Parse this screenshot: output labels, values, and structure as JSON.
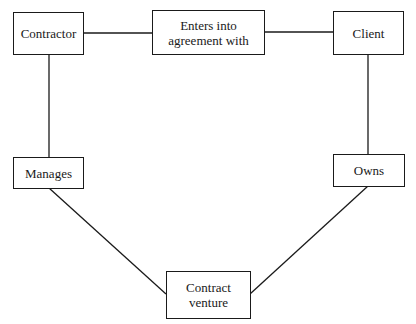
{
  "diagram": {
    "nodes": {
      "contractor": {
        "label": "Contractor"
      },
      "agreement": {
        "label": "Enters into\nagreement with"
      },
      "client": {
        "label": "Client"
      },
      "manages": {
        "label": "Manages"
      },
      "owns": {
        "label": "Owns"
      },
      "venture": {
        "label": "Contract\nventure"
      }
    },
    "edges": [
      {
        "from": "Contractor",
        "to": "Enters into agreement with"
      },
      {
        "from": "Enters into agreement with",
        "to": "Client"
      },
      {
        "from": "Contractor",
        "to": "Manages"
      },
      {
        "from": "Client",
        "to": "Owns"
      },
      {
        "from": "Manages",
        "to": "Contract venture"
      },
      {
        "from": "Owns",
        "to": "Contract venture"
      }
    ],
    "colors": {
      "stroke": "#1a1a1a",
      "background": "#ffffff"
    }
  }
}
